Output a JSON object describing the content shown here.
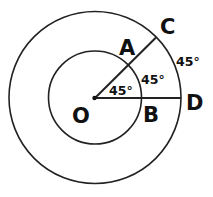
{
  "diagram": {
    "type": "concentric-circles-angle",
    "colors": {
      "stroke": "#222222",
      "text": "#111111",
      "background": "#ffffff"
    },
    "points": {
      "O": "O",
      "A": "A",
      "B": "B",
      "C": "C",
      "D": "D"
    },
    "angles": {
      "inner": "45°",
      "middle": "45°",
      "outer": "45°"
    },
    "circles": [
      {
        "name": "inner-circle",
        "center": "O",
        "through": [
          "A",
          "B"
        ]
      },
      {
        "name": "outer-circle",
        "center": "O",
        "through": [
          "C",
          "D"
        ]
      }
    ],
    "segments": [
      "OC",
      "OD"
    ]
  }
}
